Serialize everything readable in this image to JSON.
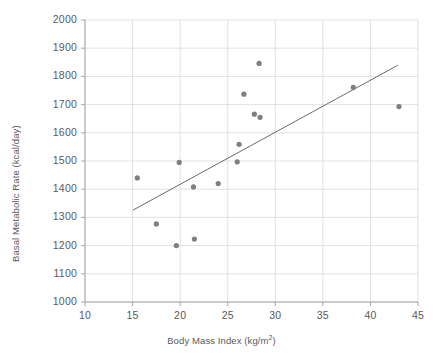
{
  "chart_data": {
    "type": "scatter",
    "title": "",
    "xlabel": "Body Mass Index (kg/m2)",
    "xlabel_base": "Body Mass Index (kg/m",
    "xlabel_exp": "2",
    "xlabel_close": ")",
    "ylabel": "Basal Metabolic Rate (kcal/day)",
    "xlim": [
      10,
      45
    ],
    "ylim": [
      1000,
      2000
    ],
    "xticks": [
      10,
      15,
      20,
      25,
      30,
      35,
      40,
      45
    ],
    "yticks": [
      1000,
      1100,
      1200,
      1300,
      1400,
      1500,
      1600,
      1700,
      1800,
      1900,
      2000
    ],
    "grid": "horizontal-and-vertical",
    "legend": "none",
    "series": [
      {
        "name": "Subjects",
        "marker": "circle",
        "color": "#7f7f7f",
        "points": [
          {
            "x": 15.5,
            "y": 1440
          },
          {
            "x": 17.5,
            "y": 1277
          },
          {
            "x": 19.6,
            "y": 1200
          },
          {
            "x": 19.9,
            "y": 1495
          },
          {
            "x": 21.4,
            "y": 1408
          },
          {
            "x": 21.5,
            "y": 1223
          },
          {
            "x": 24.0,
            "y": 1420
          },
          {
            "x": 26.0,
            "y": 1497
          },
          {
            "x": 26.2,
            "y": 1559
          },
          {
            "x": 26.7,
            "y": 1737
          },
          {
            "x": 27.8,
            "y": 1666
          },
          {
            "x": 28.3,
            "y": 1846
          },
          {
            "x": 28.4,
            "y": 1655
          },
          {
            "x": 38.2,
            "y": 1761
          },
          {
            "x": 43.0,
            "y": 1693
          }
        ]
      }
    ],
    "trendline": {
      "name": "Linear trend",
      "color": "#6b6b6b",
      "x_start": 15.05,
      "y_start": 1326,
      "x_end": 42.9,
      "y_end": 1840
    }
  },
  "axes": {
    "y_tick_labels": [
      "2000",
      "1900",
      "1800",
      "1700",
      "1600",
      "1500",
      "1400",
      "1300",
      "1200",
      "1100",
      "1000"
    ],
    "x_tick_labels": [
      "10",
      "15",
      "20",
      "25",
      "30",
      "35",
      "40",
      "45"
    ]
  },
  "colors": {
    "marker": "#7f7f7f",
    "trendline": "#6b6b6b",
    "grid": "#d9d9d9",
    "axis": "#a6a6a6",
    "text": "#5a5a5a",
    "background": "#ffffff"
  }
}
